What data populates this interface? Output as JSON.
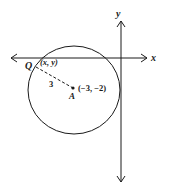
{
  "diagram": {
    "axes": {
      "x_label": "x",
      "y_label": "y"
    },
    "circle": {
      "center_label": "A",
      "center_coords": "(−3, −2)",
      "radius_label": "3"
    },
    "point": {
      "label": "Q",
      "coords": "(x, y)"
    },
    "colors": {
      "stroke": "#1a1a1a",
      "background": "#ffffff"
    }
  }
}
